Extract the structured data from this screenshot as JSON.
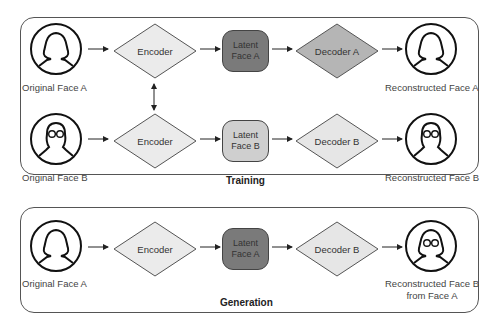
{
  "colors": {
    "latent_dark": "#7a7a7a",
    "latent_light": "#cfcfcf",
    "decoder_dark": "#b5b5b5",
    "decoder_light": "#e6e6e6",
    "encoder": "#ebebeb",
    "stroke": "#444444"
  },
  "training": {
    "title": "Training",
    "row_a": {
      "input_label": "Original Face A",
      "encoder_label": "Encoder",
      "latent_label": "Latent Face A",
      "latent_line1": "Latent",
      "latent_line2": "Face A",
      "decoder_label": "Decoder A",
      "output_label": "Reconstructed Face A"
    },
    "row_b": {
      "input_label": "Original Face B",
      "encoder_label": "Encoder",
      "latent_line1": "Latent",
      "latent_line2": "Face B",
      "decoder_label": "Decoder B",
      "output_label": "Reconstructed Face B"
    }
  },
  "generation": {
    "title": "Generation",
    "input_label": "Original Face A",
    "encoder_label": "Encoder",
    "latent_line1": "Latent",
    "latent_line2": "Face A",
    "decoder_label": "Decoder B",
    "output_line1": "Reconstructed Face B",
    "output_line2": "from Face A"
  },
  "icons": {
    "face_a": "person-female-icon",
    "face_b": "person-glasses-icon",
    "face_swapped": "person-female-glasses-icon"
  }
}
